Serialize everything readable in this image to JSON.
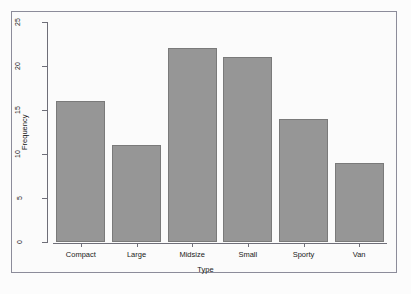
{
  "chart_data": {
    "type": "bar",
    "title": "",
    "subtitle": "",
    "xlabel": "Type",
    "ylabel": "Frequency",
    "categories": [
      "Compact",
      "Large",
      "Midsize",
      "Small",
      "Sporty",
      "Van"
    ],
    "values": [
      16,
      11,
      22,
      21,
      14,
      9
    ],
    "series": [
      {
        "name": "Frequency",
        "values": [
          16,
          11,
          22,
          21,
          14,
          9
        ]
      }
    ],
    "ylim": [
      0,
      25
    ],
    "y_ticks": [
      0,
      5,
      10,
      15,
      20,
      25
    ],
    "y_tick_labels": [
      "0",
      "5",
      "10",
      "15",
      "20",
      "25"
    ],
    "grid": false,
    "legend": false,
    "legend_position": "none",
    "bar_fill_color": "#969696",
    "bar_border_color": "#7a7a7a",
    "axis_color": "#6e6e78",
    "frame_color": "#8c8c9a",
    "background_color": "#fbfbfb",
    "text_color": "#1a1a1a"
  }
}
